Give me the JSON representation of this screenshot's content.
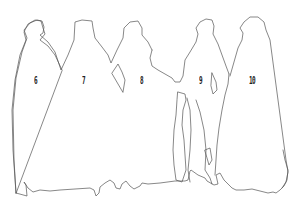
{
  "figure": {
    "stroke_color": "#555555",
    "background_color": "#ffffff",
    "labels": [
      {
        "id": "figure-6",
        "text": "6",
        "x": 34,
        "y": 75
      },
      {
        "id": "figure-7",
        "text": "7",
        "x": 82,
        "y": 75
      },
      {
        "id": "figure-8",
        "text": "8",
        "x": 140,
        "y": 75
      },
      {
        "id": "figure-9",
        "text": "9",
        "x": 199,
        "y": 75
      },
      {
        "id": "figure-10",
        "text": "10",
        "x": 249,
        "y": 75
      }
    ]
  }
}
